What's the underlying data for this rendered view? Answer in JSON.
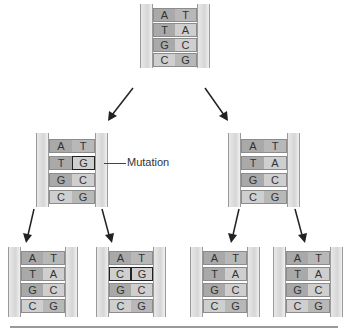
{
  "mutation_label": "Mutation",
  "colors": {
    "base_dark": "#a9a9a9",
    "base_light": "#b8b8b8",
    "backbone": "#d6d6d6",
    "arrow": "#222222"
  },
  "strands": {
    "parent": [
      [
        "A",
        "T"
      ],
      [
        "T",
        "A"
      ],
      [
        "G",
        "C"
      ],
      [
        "C",
        "G"
      ]
    ],
    "gen1_left": [
      [
        "A",
        "T"
      ],
      [
        "T",
        "G"
      ],
      [
        "G",
        "C"
      ],
      [
        "C",
        "G"
      ]
    ],
    "gen1_right": [
      [
        "A",
        "T"
      ],
      [
        "T",
        "A"
      ],
      [
        "G",
        "C"
      ],
      [
        "C",
        "G"
      ]
    ],
    "gen2_a": [
      [
        "A",
        "T"
      ],
      [
        "T",
        "A"
      ],
      [
        "G",
        "C"
      ],
      [
        "C",
        "G"
      ]
    ],
    "gen2_b": [
      [
        "A",
        "T"
      ],
      [
        "C",
        "G"
      ],
      [
        "G",
        "C"
      ],
      [
        "C",
        "G"
      ]
    ],
    "gen2_c": [
      [
        "A",
        "T"
      ],
      [
        "T",
        "A"
      ],
      [
        "G",
        "C"
      ],
      [
        "C",
        "G"
      ]
    ],
    "gen2_d": [
      [
        "A",
        "T"
      ],
      [
        "T",
        "A"
      ],
      [
        "G",
        "C"
      ],
      [
        "C",
        "G"
      ]
    ]
  }
}
